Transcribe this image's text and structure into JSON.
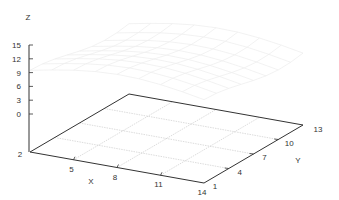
{
  "chart_data": {
    "type": "surface3d",
    "title": "",
    "xlabel": "X",
    "ylabel": "Y",
    "zlabel": "Z",
    "x_ticks": [
      2,
      5,
      8,
      11,
      14
    ],
    "y_ticks": [
      1,
      4,
      7,
      10,
      13
    ],
    "z_ticks": [
      0,
      3,
      6,
      9,
      12,
      15
    ],
    "xlim": [
      2,
      14
    ],
    "ylim": [
      1,
      13
    ],
    "zlim": [
      0,
      15
    ],
    "grid": true,
    "legend": null,
    "surface": {
      "description": "very faint, nearly invisible wireframe surface mesh floating around z≈6–12 above the base grid",
      "color": "#eeeeee"
    },
    "base_grid": {
      "divisions_x": 4,
      "divisions_y": 4,
      "color": "#bbbbbb"
    }
  },
  "colors": {
    "axis": "#333333",
    "grid": "#bbbbbb",
    "surface": "#eeeeee",
    "text": "#333333"
  }
}
